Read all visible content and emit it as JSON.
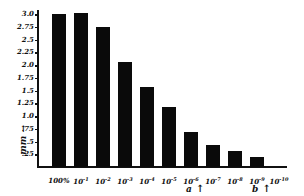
{
  "chart_data": {
    "type": "bar",
    "title": "",
    "xlabel": "",
    "ylabel": "mm →",
    "categories": [
      "100%",
      "10^-1",
      "10^-2",
      "10^-3",
      "10^-4",
      "10^-5",
      "10^-6",
      "10^-7",
      "10^-8",
      "10^-9",
      "10^-10"
    ],
    "category_display": [
      {
        "base": "100%",
        "exp": ""
      },
      {
        "base": "10",
        "exp": "-1"
      },
      {
        "base": "10",
        "exp": "-2"
      },
      {
        "base": "10",
        "exp": "-3"
      },
      {
        "base": "10",
        "exp": "-4"
      },
      {
        "base": "10",
        "exp": "-5"
      },
      {
        "base": "10",
        "exp": "-6"
      },
      {
        "base": "10",
        "exp": "-7"
      },
      {
        "base": "10",
        "exp": "-8"
      },
      {
        "base": "10",
        "exp": "-9"
      },
      {
        "base": "10",
        "exp": "-10"
      }
    ],
    "values": [
      3.0,
      3.02,
      2.75,
      2.05,
      1.57,
      1.18,
      0.69,
      0.43,
      0.31,
      0.2,
      0
    ],
    "ylim": [
      0,
      3.0
    ],
    "yticks": [
      {
        "value": 3.0,
        "label": "3.0"
      },
      {
        "value": 2.75,
        "label": "2.75"
      },
      {
        "value": 2.5,
        "label": "2.5"
      },
      {
        "value": 2.25,
        "label": "2.25"
      },
      {
        "value": 2.0,
        "label": "2.0"
      },
      {
        "value": 1.75,
        "label": "1.75"
      },
      {
        "value": 1.5,
        "label": "1.5"
      },
      {
        "value": 1.25,
        "label": "1.25"
      },
      {
        "value": 1.0,
        "label": "1.0"
      },
      {
        "value": 0.75,
        "label": ".75"
      },
      {
        "value": 0.5,
        "label": ".5"
      },
      {
        "value": 0.25,
        "label": ".25"
      }
    ],
    "grid": false,
    "legend": null,
    "annotations": [
      {
        "text": "a",
        "symbol": "↑",
        "at_category": "10^-6"
      },
      {
        "text": "b",
        "symbol": "↑",
        "at_category": "10^-9"
      }
    ],
    "bar_color": "#0a0a0a"
  }
}
